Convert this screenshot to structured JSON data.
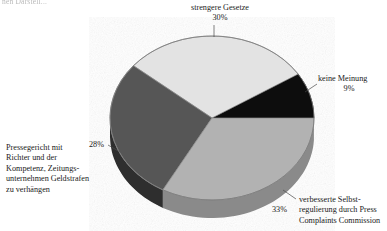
{
  "figure": {
    "cut_off_header": "nen Darstell...",
    "type": "3d-pie"
  },
  "chart_data": {
    "type": "pie",
    "title": "",
    "subtitle": "",
    "xlabel": "",
    "ylabel": "",
    "legend_position": "callout-labels",
    "grid": false,
    "three_d": true,
    "categories": [
      "strengere Gesetze",
      "keine Meinung",
      "verbesserte Selbstregulierung durch Press Complaints Commission",
      "Pressegericht mit Richter und der Kompetenz, Zeitungsunternehmen Geldstrafen zu verhängen"
    ],
    "values": [
      30,
      9,
      33,
      28
    ],
    "value_labels": [
      "30%",
      "9%",
      "33%",
      "28%"
    ],
    "colors": [
      "#e3e3e3",
      "#0d0d0d",
      "#b2b2b2",
      "#575757"
    ],
    "slices": [
      {
        "name": "strengere Gesetze",
        "value": 30,
        "value_label": "30%",
        "color": "#e3e3e3",
        "label_lines": [
          "strengere Gesetze",
          "30%"
        ]
      },
      {
        "name": "keine Meinung",
        "value": 9,
        "value_label": "9%",
        "color": "#0d0d0d",
        "label_lines": [
          "keine Meinung",
          "9%"
        ]
      },
      {
        "name": "verbesserte Selbstregulierung durch Press Complaints Commission",
        "value": 33,
        "value_label": "33%",
        "color": "#b2b2b2",
        "label_lines": [
          "verbesserte Selbst-",
          "regulierung durch Press",
          "Complaints Commission"
        ]
      },
      {
        "name": "Pressegericht mit Richter und der Kompetenz, Zeitungsunternehmen Geldstrafen zu verhängen",
        "value": 28,
        "value_label": "28%",
        "color": "#575757",
        "label_lines": [
          "Pressegericht mit",
          "Richter und der",
          "Kompetenz, Zeitungs-",
          "unternehmen Geldstrafen",
          "zu verhängen"
        ]
      }
    ]
  },
  "labels": {
    "strengere": {
      "line1": "strengere Gesetze",
      "line2": "30%"
    },
    "keine": {
      "line1": "keine Meinung",
      "line2": "9%"
    },
    "selbst": {
      "line1": "verbesserte Selbst-",
      "line2": "regulierung durch Press",
      "line3": "Complaints Commission",
      "pct": "33%"
    },
    "presse": {
      "line1": "Pressegericht mit",
      "line2": "Richter und der",
      "line3": "Kompetenz, Zeitungs-",
      "line4": "unternehmen Geldstrafen",
      "line5": "zu verhängen",
      "pct": "28%"
    }
  },
  "colors": {
    "slice_light": "#e3e3e3",
    "slice_black": "#0d0d0d",
    "slice_mid": "#b2b2b2",
    "slice_dark": "#575757",
    "wall_dark": "#3f3f3f",
    "wall_mid": "#4d4d4d",
    "outline": "#6e6e6e",
    "leader": "#4a4a4a",
    "text": "#1a1a1a",
    "background": "#ffffff"
  }
}
